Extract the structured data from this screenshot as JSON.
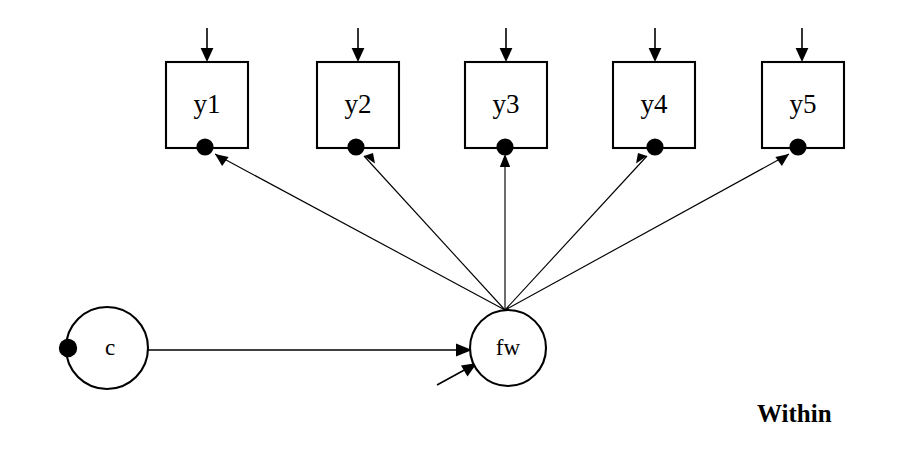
{
  "diagram": {
    "type": "structural-equation-model",
    "stroke_color": "#000000",
    "background_color": "#ffffff",
    "group_label": "Within",
    "indicators": [
      {
        "id": "y1",
        "label": "y1",
        "box_x": 166,
        "box_y": 62,
        "box_w": 82,
        "box_h": 86,
        "dot_x": 205,
        "dot_y": 147
      },
      {
        "id": "y2",
        "label": "y2",
        "box_x": 317,
        "box_y": 62,
        "box_w": 82,
        "box_h": 86,
        "dot_x": 356,
        "dot_y": 147
      },
      {
        "id": "y3",
        "label": "y3",
        "box_x": 465,
        "box_y": 62,
        "box_w": 82,
        "box_h": 86,
        "dot_x": 505,
        "dot_y": 147
      },
      {
        "id": "y4",
        "label": "y4",
        "box_x": 613,
        "box_y": 62,
        "box_w": 82,
        "box_h": 86,
        "dot_x": 655,
        "dot_y": 147
      },
      {
        "id": "y5",
        "label": "y5",
        "box_x": 762,
        "box_y": 62,
        "box_w": 82,
        "box_h": 86,
        "dot_x": 798,
        "dot_y": 147
      }
    ],
    "latent_factor": {
      "id": "fw",
      "label": "fw",
      "cx": 508,
      "cy": 348,
      "r": 38
    },
    "covariate": {
      "id": "c",
      "label": "c",
      "cx": 107,
      "cy": 348,
      "r": 41,
      "dot_x": 68,
      "dot_y": 348
    },
    "fan_origin": {
      "x": 505,
      "y": 310
    },
    "loadings": [
      {
        "from": "fw",
        "to": "y1"
      },
      {
        "from": "fw",
        "to": "y2"
      },
      {
        "from": "fw",
        "to": "y3"
      },
      {
        "from": "fw",
        "to": "y4"
      },
      {
        "from": "fw",
        "to": "y5"
      }
    ],
    "regression": {
      "from": "c",
      "to": "fw"
    },
    "factor_residual": {
      "to": "fw"
    },
    "within_label_x": 757,
    "within_label_y": 422
  }
}
